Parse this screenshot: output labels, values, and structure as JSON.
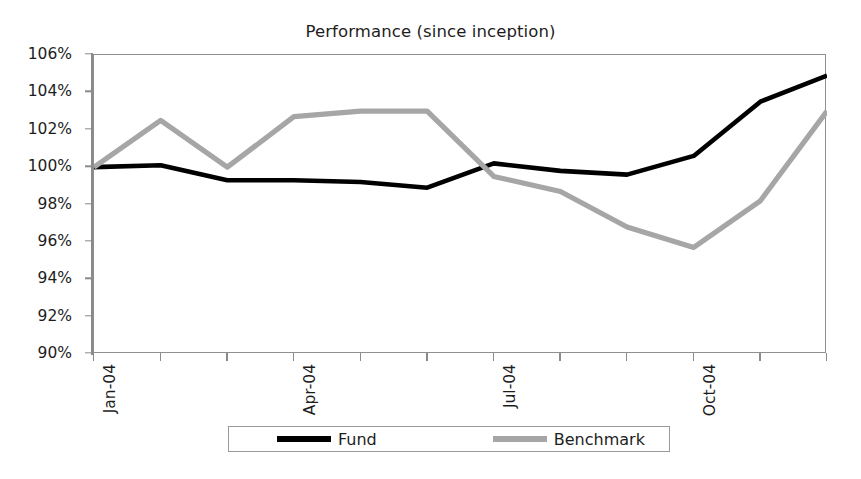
{
  "chart_data": {
    "type": "line",
    "title": "Performance (since inception)",
    "xlabel": "",
    "ylabel": "",
    "grid": false,
    "legend_position": "bottom",
    "ylim": [
      90,
      106
    ],
    "ytick_labels": [
      "106%",
      "104%",
      "102%",
      "100%",
      "98%",
      "96%",
      "94%",
      "92%",
      "90%"
    ],
    "ytick_values": [
      106,
      104,
      102,
      100,
      98,
      96,
      94,
      92,
      90
    ],
    "x": [
      "Jan-04",
      "Feb-04",
      "Mar-04",
      "Apr-04",
      "May-04",
      "Jun-04",
      "Jul-04",
      "Aug-04",
      "Sep-04",
      "Oct-04",
      "Nov-04",
      "Dec-04"
    ],
    "xtick_labels": [
      "Jan-04",
      "Apr-04",
      "Jul-04",
      "Oct-04"
    ],
    "xtick_indices": [
      0,
      3,
      6,
      9
    ],
    "series": [
      {
        "name": "Fund",
        "color": "#000000",
        "values": [
          100.0,
          100.1,
          99.3,
          99.3,
          99.2,
          98.9,
          100.2,
          99.8,
          99.6,
          100.6,
          103.5,
          104.9
        ]
      },
      {
        "name": "Benchmark",
        "color": "#a6a6a6",
        "values": [
          100.0,
          102.5,
          100.0,
          102.7,
          103.0,
          103.0,
          99.5,
          98.7,
          96.8,
          95.7,
          98.2,
          103.0
        ]
      }
    ]
  },
  "legend": {
    "fund_label": "Fund",
    "benchmark_label": "Benchmark"
  }
}
